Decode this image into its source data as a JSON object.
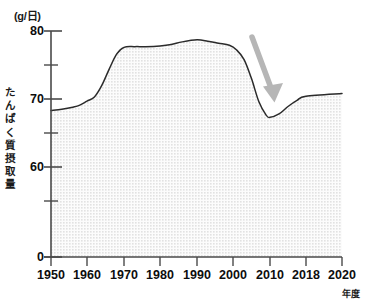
{
  "chart_data": {
    "type": "area",
    "title": "",
    "unit_label": "(g/日)",
    "xlabel": "年度",
    "ylabel": "たんぱく質摂取量",
    "ylabel_chars": [
      "た",
      "ん",
      "ぱ",
      "く",
      "質",
      "摂",
      "取",
      "量"
    ],
    "x": [
      1950,
      1960,
      1970,
      1980,
      1990,
      2000,
      2010,
      2018,
      2020
    ],
    "categories": [
      "1950",
      "1960",
      "1970",
      "1980",
      "1990",
      "2000",
      "2010",
      "2018",
      "2020"
    ],
    "values": [
      68.3,
      69.7,
      77.6,
      77.9,
      78.7,
      77.7,
      67.3,
      70.4,
      70.8
    ],
    "series": [
      {
        "name": "たんぱく質摂取量",
        "values": [
          68.3,
          69.7,
          77.6,
          77.9,
          78.7,
          77.7,
          67.3,
          70.4,
          70.8
        ]
      }
    ],
    "ylim": [
      0,
      80
    ],
    "xlim": [
      1950,
      2020
    ],
    "y_major_ticks": [
      0,
      60,
      70,
      80
    ],
    "y_major_tick_labels": [
      "0",
      "60",
      "70",
      "80"
    ],
    "y_minor_ticks": [
      55,
      65,
      75
    ],
    "axis_break": true,
    "grid": false,
    "legend": "none",
    "fill_color": "#efefef",
    "line_color": "#2b2b2b",
    "axis_color": "#4a4a4a",
    "annotations": [
      {
        "type": "arrow",
        "name": "decline-arrow",
        "color": "#b5b5b5",
        "from_x": 2003.5,
        "from_y": 79.4,
        "to_x": 2007.0,
        "to_y": 70.6,
        "description": "灰色の下向き矢印"
      }
    ]
  }
}
